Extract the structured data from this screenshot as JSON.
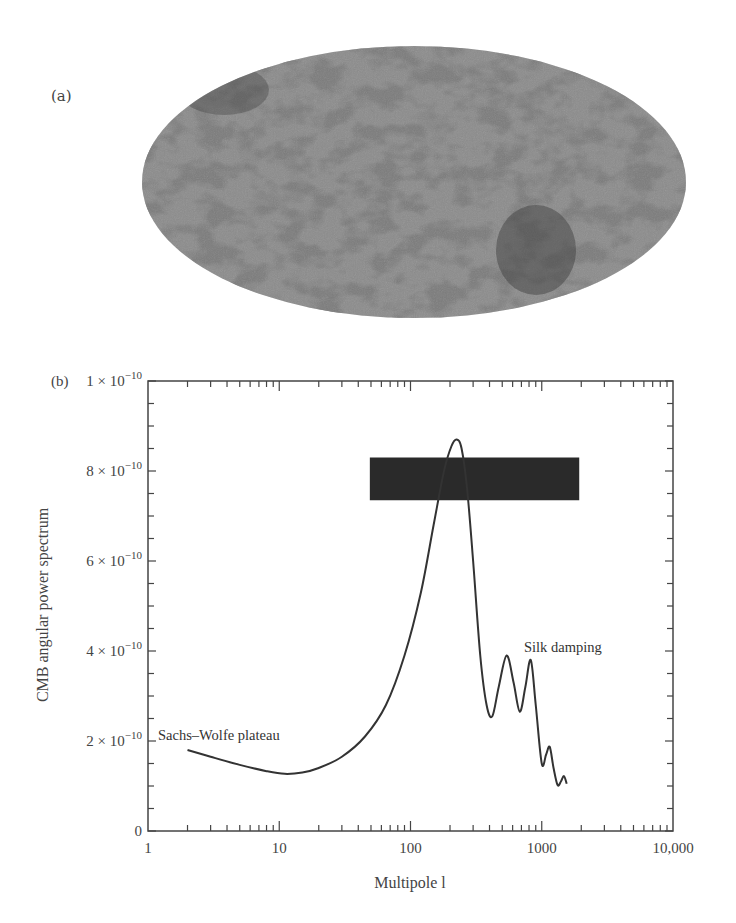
{
  "panels": {
    "a": {
      "label": "(a)",
      "description": "All-sky CMB temperature map (Mollweide projection)"
    },
    "b": {
      "label": "(b)"
    }
  },
  "colors": {
    "map_base": "#8c8c8c",
    "map_dark": "#3a3a3a",
    "curve": "#333333",
    "axis": "#444444",
    "box": "#2a2a2a"
  },
  "chart_data": {
    "type": "line",
    "title": "",
    "xlabel": "Multipole l",
    "ylabel": "CMB angular power spectrum",
    "xscale": "log",
    "xlim": [
      1,
      10000
    ],
    "ylim": [
      0,
      1e-09
    ],
    "grid": false,
    "legend": null,
    "x_tick_labels": [
      "1",
      "10",
      "100",
      "1000",
      "10,000"
    ],
    "x_ticks": [
      1,
      10,
      100,
      1000,
      10000
    ],
    "y_tick_labels": [
      "0",
      "2 × 10^−10",
      "4 × 10^−10",
      "6 × 10^−10",
      "8 × 10^−10",
      "1 × 10^−10"
    ],
    "y_ticks": [
      0,
      2e-10,
      4e-10,
      6e-10,
      8e-10,
      1e-09
    ],
    "series": [
      {
        "name": "CMB power spectrum",
        "x": [
          2,
          3,
          5,
          8,
          11,
          15,
          20,
          30,
          45,
          65,
          90,
          120,
          150,
          180,
          205,
          225,
          245,
          270,
          300,
          340,
          380,
          420,
          470,
          540,
          610,
          680,
          750,
          825,
          900,
          1000,
          1080,
          1150,
          1230,
          1320,
          1400,
          1475,
          1550
        ],
        "y": [
          1.8e-10,
          1.65e-10,
          1.47e-10,
          1.33e-10,
          1.27e-10,
          1.3e-10,
          1.4e-10,
          1.65e-10,
          2.1e-10,
          2.8e-10,
          3.9e-10,
          5.3e-10,
          6.8e-10,
          8e-10,
          8.55e-10,
          8.7e-10,
          8.5e-10,
          7.6e-10,
          6e-10,
          3.9e-10,
          2.8e-10,
          2.55e-10,
          3.2e-10,
          3.9e-10,
          3.3e-10,
          2.65e-10,
          3.2e-10,
          3.8e-10,
          2.8e-10,
          1.5e-10,
          1.7e-10,
          1.87e-10,
          1.4e-10,
          1.02e-10,
          1.1e-10,
          1.22e-10,
          1.05e-10
        ]
      }
    ],
    "shaded_box": {
      "x": [
        49,
        1930
      ],
      "y": [
        7.35e-10,
        8.3e-10
      ],
      "description": "Dark rectangle denoting measurement band near first acoustic peak"
    },
    "annotations": [
      {
        "text": "Sachs–Wolfe plateau",
        "x": 1.1,
        "y": 1.95e-10
      },
      {
        "text": "Silk damping",
        "x": 1000,
        "y": 3.8e-10
      }
    ]
  }
}
